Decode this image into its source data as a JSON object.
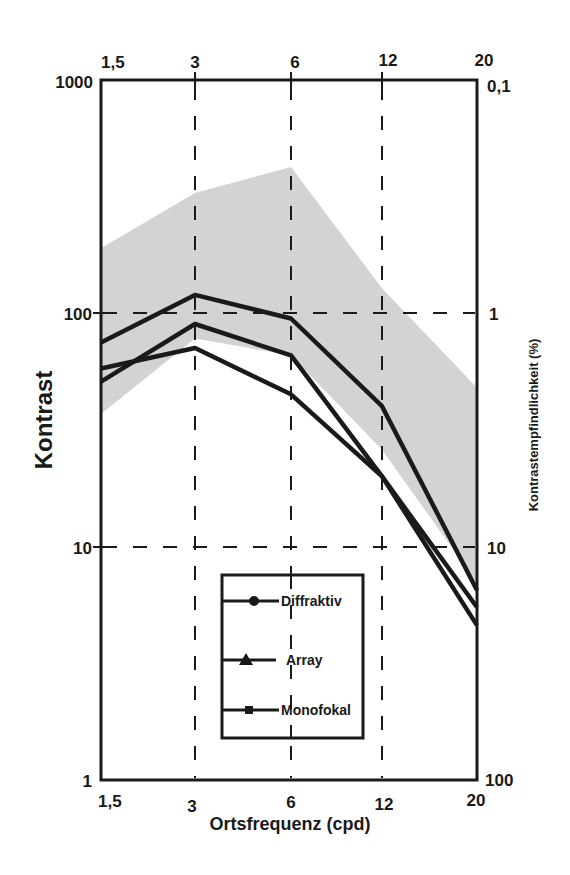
{
  "chart_data": {
    "type": "line",
    "title": "",
    "xlabel": "Ortsfrequenz (cpd)",
    "ylabel": "Kontrast",
    "ylabel_right": "Kontrastempfindlichkeit (%)",
    "x": [
      "1,5",
      "3",
      "6",
      "12",
      "20"
    ],
    "x_top": [
      "1,5",
      "3",
      "6",
      "12",
      "20"
    ],
    "yscale": "log",
    "ylim": [
      1,
      1000
    ],
    "yticks": [
      "1",
      "10",
      "100",
      "1000"
    ],
    "yticks_right": [
      "100",
      "10",
      "1",
      "0,1"
    ],
    "grid": "dashed at x=3,6,12 and y=10,100",
    "legend_position": "lower center inside plot",
    "series": [
      {
        "name": "Diffraktiv",
        "marker": "circle",
        "values": [
          75,
          120,
          95,
          40,
          6.5
        ]
      },
      {
        "name": "Array",
        "marker": "triangle",
        "values": [
          51,
          90,
          66,
          20,
          5.5
        ]
      },
      {
        "name": "Monofokal",
        "marker": "square",
        "values": [
          58,
          71,
          45,
          20,
          4.6
        ]
      }
    ],
    "normal_range_band": {
      "upper": [
        190,
        328,
        424,
        128,
        48
      ],
      "lower": [
        37,
        78,
        66,
        26,
        7
      ],
      "color": "#d3d3d3"
    }
  },
  "axes": {
    "left_ticks": [
      {
        "label": "1000",
        "y": 80
      },
      {
        "label": "100",
        "y": 313
      },
      {
        "label": "10",
        "y": 547
      },
      {
        "label": "1",
        "y": 780
      }
    ],
    "right_ticks": [
      {
        "label": "0,1",
        "y": 80
      },
      {
        "label": "1",
        "y": 313
      },
      {
        "label": "10",
        "y": 547
      },
      {
        "label": "100",
        "y": 780
      }
    ],
    "bottom_ticks": [
      "1,5",
      "3",
      "6",
      "12",
      "20"
    ],
    "top_ticks": [
      "1,5",
      "3",
      "6",
      "12",
      "20"
    ],
    "xlabel": "Ortsfrequenz (cpd)",
    "ylabel": "Kontrast",
    "ylabel_right": "Kontrastempfindlichkeit (%)"
  },
  "legend": {
    "items": [
      {
        "label": "Diffraktiv",
        "marker": "circle"
      },
      {
        "label": "Array",
        "marker": "triangle"
      },
      {
        "label": "Monofokal",
        "marker": "square"
      }
    ]
  },
  "colors": {
    "line": "#1a1a1a",
    "band": "#d3d3d3",
    "background": "#ffffff"
  }
}
